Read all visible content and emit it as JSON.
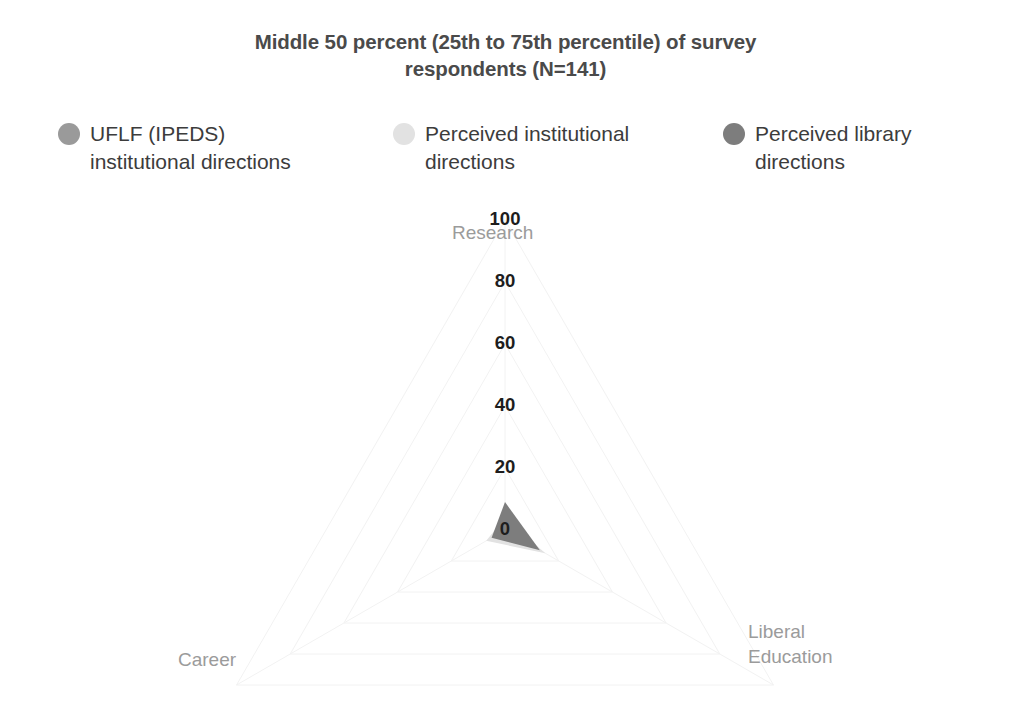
{
  "chart_data": {
    "type": "radar",
    "title": "Middle 50 percent (25th to 75th percentile) of survey respondents (N=141)",
    "title_lines": [
      "Middle 50 percent (25th to 75th percentile) of survey",
      "respondents (N=141)"
    ],
    "categories": [
      "Research",
      "Career",
      "Liberal Education"
    ],
    "tick_labels": [
      "100",
      "80",
      "60",
      "40",
      "20",
      "0"
    ],
    "tick_values": [
      100,
      80,
      60,
      40,
      20,
      0
    ],
    "rlim": [
      0,
      100
    ],
    "r_inverted": true,
    "grid": true,
    "legend_position": "top",
    "series": [
      {
        "name": "UFLF (IPEDS) institutional directions",
        "name_lines": [
          "UFLF (IPEDS)",
          "institutional directions"
        ],
        "color": "#9a9a9a",
        "values": [
          8,
          4,
          11
        ]
      },
      {
        "name": "Perceived institutional directions",
        "name_lines": [
          "Perceived institutional",
          "directions"
        ],
        "color": "#e2e2e2",
        "values": [
          4,
          7,
          15
        ]
      },
      {
        "name": "Perceived library directions",
        "name_lines": [
          "Perceived library",
          "directions"
        ],
        "color": "#7d7d7d",
        "values": [
          9,
          5,
          13
        ]
      }
    ],
    "axis_label_color": "#9b9b9b",
    "tick_label_color": "#1d1d1d",
    "title_color": "#4a4a4a",
    "background_color": "#ffffff",
    "grid_color": "#f2f2f2"
  }
}
